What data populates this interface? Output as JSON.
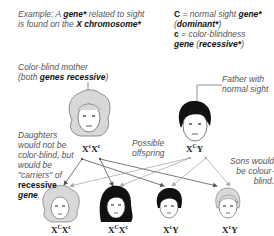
{
  "example": {
    "line1_pre": "Example: A ",
    "line1_bold": "gene*",
    "line1_post": " related to sight",
    "line2_pre": "is found on the ",
    "line2_bold": "X chromosome*"
  },
  "legend": {
    "dominant_symbol": "C",
    "dominant_pre": " = normal sight ",
    "dominant_bold": "gene*",
    "dominant_paren": "dominant*",
    "recessive_symbol": "c",
    "recessive_pre": " = color-blindness",
    "recessive_bold": "gene",
    "recessive_paren": "recessive*"
  },
  "mother": {
    "label_line1": "Color-blind mother",
    "label_pre": "(both ",
    "label_bold": "genes recessive",
    "label_post": ")",
    "genotype": {
      "a": "X",
      "a_sup": "c",
      "b": "X",
      "b_sup": "c"
    }
  },
  "father": {
    "label_line1": "Father with",
    "label_line2": "normal sight",
    "genotype": {
      "a": "X",
      "a_sup": "C",
      "b": "Y"
    }
  },
  "annotations": {
    "possible_line1": "Possible",
    "possible_line2": "offspring",
    "daughters": [
      "Daughters",
      "would not be",
      "color-blind, but",
      "would be",
      "\"carriers\" of"
    ],
    "daughters_bold1": "recessive",
    "daughters_bold2": "gene",
    "sons": [
      "Sons would",
      "be colour-",
      "blind."
    ]
  },
  "offspring": [
    {
      "a": "X",
      "a_sup": "C",
      "b": "X",
      "b_sup": "c",
      "sex": "daughter",
      "hair": "light"
    },
    {
      "a": "X",
      "a_sup": "C",
      "b": "X",
      "b_sup": "c",
      "sex": "daughter",
      "hair": "dark"
    },
    {
      "a": "X",
      "a_sup": "c",
      "b": "Y",
      "b_sup": "",
      "sex": "son",
      "hair": "dark"
    },
    {
      "a": "X",
      "a_sup": "c",
      "b": "Y",
      "b_sup": "",
      "sex": "son",
      "hair": "light"
    }
  ],
  "colors": {
    "mother_arrow": "#555555",
    "father_arrow": "#aaaaaa",
    "light_hair": "#d8d8d8",
    "dark_hair": "#111111"
  }
}
